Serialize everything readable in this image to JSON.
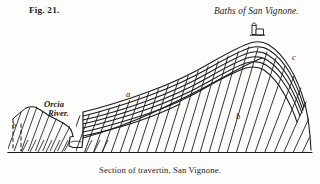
{
  "figure": {
    "number": "Fig. 21.",
    "locality_title": "Baths of San Vignone.",
    "caption": "Section of travertin, San Vignone.",
    "river_label": "Orcia\nRiver.",
    "river_label_line1": "Orcia",
    "river_label_line2": "River.",
    "keys": {
      "a": "a",
      "b_left": "b",
      "b_right": "b",
      "c": "c"
    },
    "ink_color": "#1b1b1b",
    "paper_color": "#fdfdfc"
  }
}
